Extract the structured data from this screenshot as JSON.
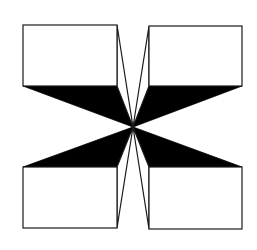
{
  "figure": {
    "type": "geometric-illusion",
    "background": "#ffffff",
    "ink_color": "#000000",
    "center": [
      133,
      127
    ],
    "boxes": [
      {
        "name": "top-left",
        "x1": 23,
        "y1": 25,
        "x2": 117,
        "y2": 86
      },
      {
        "name": "top-right",
        "x1": 149,
        "y1": 26,
        "x2": 242,
        "y2": 86
      },
      {
        "name": "bottom-left",
        "x1": 23,
        "y1": 167,
        "x2": 117,
        "y2": 228
      },
      {
        "name": "bottom-right",
        "x1": 149,
        "y1": 167,
        "x2": 242,
        "y2": 229
      }
    ]
  }
}
